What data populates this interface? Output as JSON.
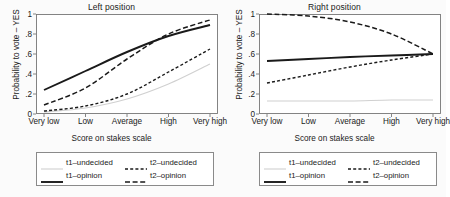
{
  "figure": {
    "background": "#fbfbfb",
    "panels": [
      {
        "id": "left",
        "title": "Left position",
        "xlabel": "Score on stakes scale",
        "ylabel": "Probability to vote – YES"
      },
      {
        "id": "right",
        "title": "Right position",
        "xlabel": "Score on stakes scale",
        "ylabel": "Probability to vote – YES"
      }
    ],
    "legend": {
      "items": [
        {
          "label": "t1–undecided",
          "style": "solid-light",
          "color": "#d0d0d0"
        },
        {
          "label": "t2–undecided",
          "style": "dashed-fine",
          "color": "#1a1a1a"
        },
        {
          "label": "t1–opinion",
          "style": "solid-bold",
          "color": "#1a1a1a"
        },
        {
          "label": "t2–opinion",
          "style": "dashed-coarse",
          "color": "#1a1a1a"
        }
      ]
    }
  },
  "chart_data": [
    {
      "type": "line",
      "title": "Left position",
      "xlabel": "Score on stakes scale",
      "ylabel": "Probability to vote – YES",
      "categories": [
        "Very low",
        "Low",
        "Average",
        "High",
        "Very high"
      ],
      "x": [
        1,
        2,
        3,
        4,
        5
      ],
      "ylim": [
        0,
        1
      ],
      "yticks": [
        0,
        0.2,
        0.4,
        0.6,
        0.8,
        1
      ],
      "ytick_labels": [
        "0",
        ".2",
        ".4",
        ".6",
        ".8",
        "1"
      ],
      "grid": false,
      "legend_position": "below",
      "series": [
        {
          "name": "t1–undecided",
          "color": "#d0d0d0",
          "style": "solid-light",
          "values": [
            0.02,
            0.06,
            0.15,
            0.3,
            0.5
          ]
        },
        {
          "name": "t2–undecided",
          "color": "#1a1a1a",
          "style": "dashed-fine",
          "values": [
            0.03,
            0.08,
            0.2,
            0.42,
            0.65
          ]
        },
        {
          "name": "t1–opinion",
          "color": "#1a1a1a",
          "style": "solid-bold",
          "values": [
            0.24,
            0.43,
            0.62,
            0.78,
            0.89
          ]
        },
        {
          "name": "t2–opinion",
          "color": "#1a1a1a",
          "style": "dashed-coarse",
          "values": [
            0.09,
            0.26,
            0.55,
            0.8,
            0.94
          ]
        }
      ]
    },
    {
      "type": "line",
      "title": "Right position",
      "xlabel": "Score on stakes scale",
      "ylabel": "Probability to vote – YES",
      "categories": [
        "Very low",
        "Low",
        "Average",
        "High",
        "Very high"
      ],
      "x": [
        1,
        2,
        3,
        4,
        5
      ],
      "ylim": [
        0,
        1
      ],
      "yticks": [
        0,
        0.2,
        0.4,
        0.6,
        0.8,
        1
      ],
      "ytick_labels": [
        "0",
        ".2",
        ".4",
        ".6",
        ".8",
        "1"
      ],
      "grid": false,
      "legend_position": "below",
      "series": [
        {
          "name": "t1–undecided",
          "color": "#d0d0d0",
          "style": "solid-light",
          "values": [
            0.13,
            0.13,
            0.13,
            0.14,
            0.14
          ]
        },
        {
          "name": "t2–undecided",
          "color": "#1a1a1a",
          "style": "dashed-fine",
          "values": [
            0.31,
            0.39,
            0.47,
            0.54,
            0.6
          ]
        },
        {
          "name": "t1–opinion",
          "color": "#1a1a1a",
          "style": "solid-bold",
          "values": [
            0.53,
            0.55,
            0.57,
            0.585,
            0.6
          ]
        },
        {
          "name": "t2–opinion",
          "color": "#1a1a1a",
          "style": "dashed-coarse",
          "values": [
            1.0,
            0.98,
            0.92,
            0.8,
            0.6
          ]
        }
      ]
    }
  ]
}
